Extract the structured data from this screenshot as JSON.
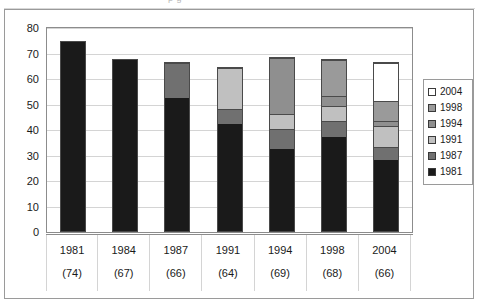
{
  "crop_remnant_text": "p g",
  "chart_data": {
    "type": "bar",
    "subtype": "stacked-column",
    "title": "",
    "xlabel": "",
    "ylabel": "",
    "ylim": [
      0,
      80
    ],
    "yticks": [
      0,
      10,
      20,
      30,
      40,
      50,
      60,
      70,
      80
    ],
    "grid": true,
    "legend_position": "right",
    "categories": [
      "1981",
      "1984",
      "1987",
      "1991",
      "1994",
      "1998",
      "2004"
    ],
    "category_counts": [
      "(74)",
      "(67)",
      "(66)",
      "(64)",
      "(69)",
      "(68)",
      "(66)"
    ],
    "series": [
      {
        "name": "1981",
        "color": "#1a1a1a",
        "values": [
          74,
          67,
          52,
          42,
          32,
          37,
          28
        ]
      },
      {
        "name": "1987",
        "color": "#707070",
        "values": [
          0,
          0,
          14,
          6,
          8,
          6,
          5
        ]
      },
      {
        "name": "1991",
        "color": "#c0c0c0",
        "values": [
          0,
          0,
          0,
          16,
          6,
          6,
          8
        ]
      },
      {
        "name": "1994",
        "color": "#8f8f8f",
        "values": [
          0,
          0,
          0,
          0,
          22,
          4,
          2
        ]
      },
      {
        "name": "1998",
        "color": "#9a9a9a",
        "values": [
          0,
          0,
          0,
          0,
          0,
          14,
          8
        ]
      },
      {
        "name": "2004",
        "color": "#ffffff",
        "values": [
          0,
          0,
          0,
          0,
          0,
          0,
          15
        ]
      }
    ],
    "totals": [
      74,
      67,
      66,
      64,
      68,
      67,
      66
    ]
  },
  "legend": {
    "items": [
      {
        "label": "2004",
        "color": "#ffffff"
      },
      {
        "label": "1998",
        "color": "#9a9a9a"
      },
      {
        "label": "1994",
        "color": "#8f8f8f"
      },
      {
        "label": "1991",
        "color": "#c0c0c0"
      },
      {
        "label": "1987",
        "color": "#707070"
      },
      {
        "label": "1981",
        "color": "#1a1a1a"
      }
    ]
  }
}
